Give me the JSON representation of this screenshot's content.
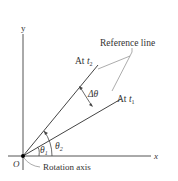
{
  "figure": {
    "axes": {
      "x_label": "x",
      "y_label": "y",
      "origin_label": "O"
    },
    "labels": {
      "reference_line": "Reference line",
      "at_t2_prefix": "At ",
      "at_t2_var": "t",
      "at_t2_sub": "2",
      "at_t1_prefix": "At ",
      "at_t1_var": "t",
      "at_t1_sub": "1",
      "delta_theta": "Δθ",
      "theta1": "θ",
      "theta1_sub": "1",
      "theta2": "θ",
      "theta2_sub": "2",
      "rotation_axis": "Rotation axis"
    },
    "colors": {
      "line": "#444444",
      "axis": "#555555",
      "leader": "#888888",
      "text": "#333333"
    }
  }
}
